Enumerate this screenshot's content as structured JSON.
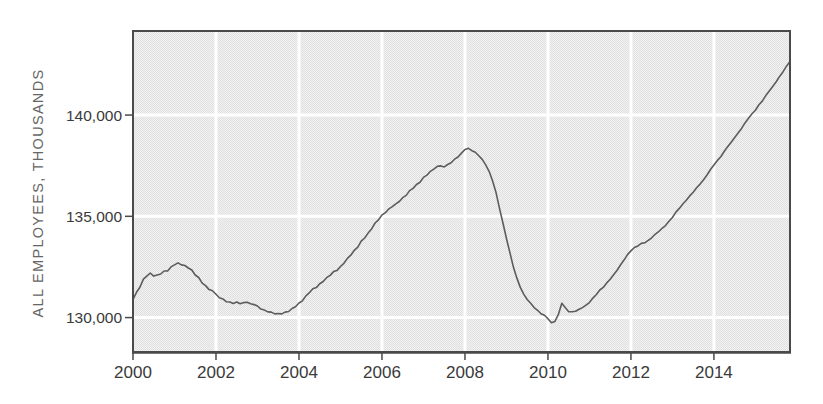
{
  "figure": {
    "ylabel": "ALL EMPLOYEES, THOUSANDS"
  },
  "colors": {
    "frame": "#4a4a4a",
    "plot_bg_light": "#f2f2f2",
    "plot_bg_dark": "#e0e0e0",
    "gridline": "#ffffff",
    "series_line": "#5c5c5c",
    "tick_label": "#3a3a3a",
    "axis_title": "#666666",
    "page_bg": "#ffffff"
  },
  "chart_data": {
    "type": "line",
    "title": "",
    "xlabel": "",
    "ylabel": "ALL EMPLOYEES, THOUSANDS",
    "grid": true,
    "legend": "none",
    "xlim": [
      2000,
      2015.8333
    ],
    "ylim": [
      128300,
      144150
    ],
    "x_start": 2000.0,
    "x_step_years": 0.0833333,
    "x_ticks": [
      {
        "v": 2000,
        "label": "2000"
      },
      {
        "v": 2002,
        "label": "2002"
      },
      {
        "v": 2004,
        "label": "2004"
      },
      {
        "v": 2006,
        "label": "2006"
      },
      {
        "v": 2008,
        "label": "2008"
      },
      {
        "v": 2010,
        "label": "2010"
      },
      {
        "v": 2012,
        "label": "2012"
      },
      {
        "v": 2014,
        "label": "2014"
      }
    ],
    "y_ticks": [
      {
        "v": 130000,
        "label": "130,000"
      },
      {
        "v": 135000,
        "label": "135,000"
      },
      {
        "v": 140000,
        "label": "140,000"
      }
    ],
    "series": [
      {
        "values": [
          130900,
          131250,
          131500,
          131900,
          132050,
          132200,
          132050,
          132100,
          132150,
          132300,
          132300,
          132500,
          132600,
          132700,
          132600,
          132570,
          132450,
          132350,
          132100,
          131980,
          131700,
          131580,
          131380,
          131320,
          131150,
          130980,
          130920,
          130780,
          130770,
          130700,
          130770,
          130680,
          130740,
          130760,
          130680,
          130640,
          130570,
          130420,
          130370,
          130280,
          130270,
          130180,
          130200,
          130180,
          130270,
          130300,
          130450,
          130530,
          130720,
          130830,
          131070,
          131230,
          131420,
          131480,
          131670,
          131780,
          131970,
          132080,
          132270,
          132330,
          132520,
          132680,
          132920,
          133080,
          133320,
          133480,
          133770,
          133930,
          134170,
          134380,
          134670,
          134830,
          135070,
          135180,
          135370,
          135480,
          135620,
          135730,
          135920,
          136030,
          136270,
          136380,
          136570,
          136680,
          136920,
          137030,
          137220,
          137330,
          137470,
          137490,
          137440,
          137560,
          137640,
          137820,
          137930,
          138120,
          138300,
          138360,
          138240,
          138160,
          137990,
          137810,
          137540,
          137210,
          136740,
          136160,
          135390,
          134660,
          133890,
          133210,
          132490,
          131960,
          131490,
          131160,
          130890,
          130710,
          130490,
          130360,
          130190,
          130110,
          129940,
          129740,
          129810,
          130140,
          130710,
          130490,
          130290,
          130290,
          130310,
          130410,
          130490,
          130610,
          130740,
          130960,
          131140,
          131360,
          131490,
          131710,
          131890,
          132110,
          132340,
          132610,
          132840,
          133110,
          133290,
          133460,
          133540,
          133660,
          133690,
          133810,
          133940,
          134110,
          134240,
          134410,
          134540,
          134760,
          134940,
          135210,
          135390,
          135610,
          135790,
          136010,
          136190,
          136410,
          136590,
          136810,
          137040,
          137310,
          137540,
          137760,
          137940,
          138210,
          138440,
          138660,
          138890,
          139110,
          139340,
          139610,
          139840,
          140060,
          140240,
          140510,
          140690,
          140960,
          141190,
          141410,
          141640,
          141910,
          142140,
          142410,
          142650
        ]
      }
    ]
  }
}
